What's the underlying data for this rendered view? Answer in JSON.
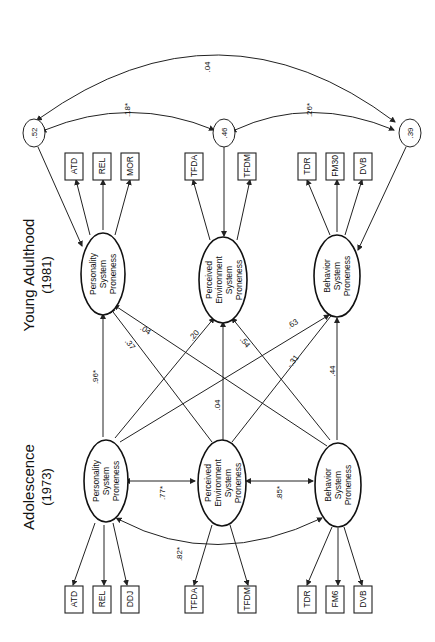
{
  "titles": {
    "time1": {
      "label": "Adolescence",
      "year": "(1973)"
    },
    "time2": {
      "label": "Young Adulthood",
      "year": "(1981)"
    }
  },
  "latents": {
    "t1_personality": [
      "Personality",
      "System",
      "Proneness"
    ],
    "t1_environment": [
      "Perceived",
      "Environment",
      "System",
      "Proneness"
    ],
    "t1_behavior": [
      "Behavior",
      "System",
      "Proneness"
    ],
    "t2_personality": [
      "Personality",
      "System",
      "Proneness"
    ],
    "t2_environment": [
      "Perceived",
      "Environment",
      "System",
      "Proneness"
    ],
    "t2_behavior": [
      "Behavior",
      "System",
      "Proneness"
    ]
  },
  "indicators": {
    "t1": [
      "ATD",
      "REL",
      "DDJ",
      "TFDA",
      "TFDM",
      "TDR",
      "FM6",
      "DVB"
    ],
    "t2": [
      "ATD",
      "REL",
      "MOR",
      "TFDA",
      "TFDM",
      "TDR",
      "FM30",
      "DVB"
    ]
  },
  "residuals": {
    "personality": ".52",
    "environment": ".46",
    "behavior": ".39"
  },
  "coefficients": {
    "t1_pers_env": ".77*",
    "t1_env_beh": ".85*",
    "t1_pers_beh": ".82*",
    "pers_to_pers": ".96*",
    "env_to_env": ".04",
    "beh_to_beh": ".44",
    "pers_to_env": ".20",
    "pers_to_beh": ".63",
    "env_to_pers": ".37",
    "env_to_beh": "-.31",
    "beh_to_pers": ".04",
    "beh_to_env": ".54",
    "res_pers_env": ".18*",
    "res_env_beh": ".26*",
    "res_pers_beh": ".04"
  }
}
